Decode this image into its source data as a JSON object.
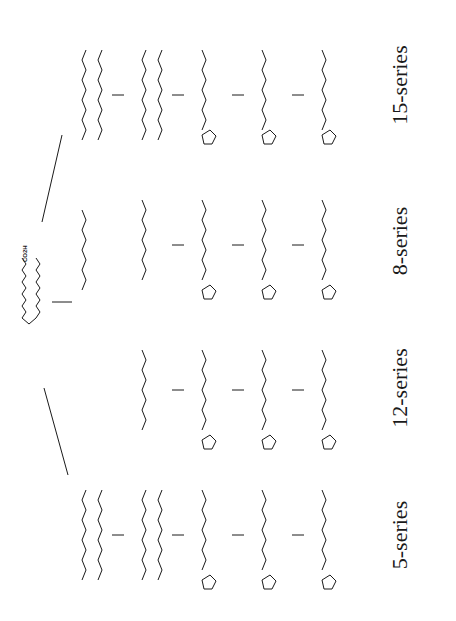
{
  "figure": {
    "orientation": "rotated-90-ccw",
    "series_labels": [
      "5-series",
      "12-series",
      "8-series",
      "15-series"
    ],
    "parent": {
      "label": "CO2H",
      "name": "arachidonic-acid"
    },
    "reagents": {
      "oxygen": "O2",
      "reduction": "[H]"
    },
    "groups": {
      "acid": "CO2H",
      "peroxyl": "O-O·",
      "hydroperoxide": "OOH",
      "hydroxyl": "OH",
      "endoperoxide": "O-O"
    },
    "columns": [
      {
        "series": "5-series",
        "steps": [
          "radical",
          "peroxyl O-O·",
          "endoperoxide radical",
          "OOH",
          "[H] → OH, OH"
        ]
      },
      {
        "series": "12-series",
        "steps": [
          "peroxyl O-O·",
          "endoperoxide radical",
          "OOH",
          "[H] → OH, OH"
        ]
      },
      {
        "series": "8-series",
        "steps": [
          "peroxyl O-O·",
          "endoperoxide radical",
          "OOH",
          "[H] → OH, OH"
        ]
      },
      {
        "series": "15-series",
        "steps": [
          "radical",
          "peroxyl O-O·",
          "endoperoxide radical",
          "OOH",
          "[H] → OH, OH"
        ]
      }
    ]
  }
}
